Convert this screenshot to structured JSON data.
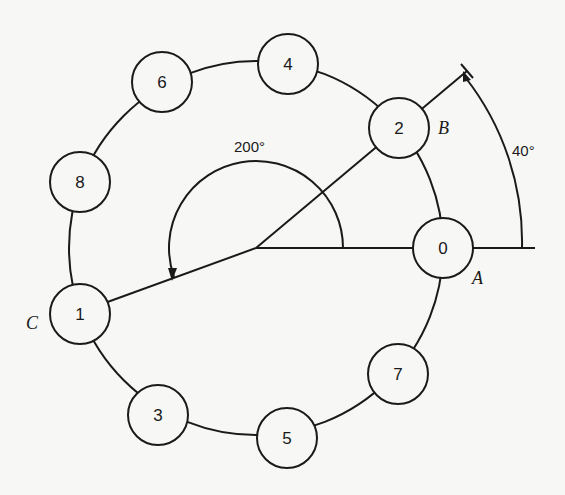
{
  "figure": {
    "type": "circular slot diagram",
    "center": {
      "x": 256,
      "y": 248
    },
    "ring_radius": 187,
    "node_radius": 30,
    "nodes": [
      {
        "label": "0",
        "angle_deg": 0
      },
      {
        "label": "2",
        "angle_deg": 40
      },
      {
        "label": "4",
        "angle_deg": 80
      },
      {
        "label": "6",
        "angle_deg": 120
      },
      {
        "label": "8",
        "angle_deg": 160
      },
      {
        "label": "1",
        "angle_deg": 200
      },
      {
        "label": "3",
        "angle_deg": 240
      },
      {
        "label": "5",
        "angle_deg": 280
      },
      {
        "label": "7",
        "angle_deg": 320
      }
    ],
    "point_labels": {
      "A": "A",
      "B": "B",
      "C": "C"
    },
    "angles": {
      "small": "40°",
      "large": "200°"
    }
  }
}
